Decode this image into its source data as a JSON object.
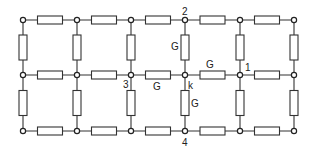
{
  "diagram": {
    "type": "resistor-grid-network",
    "columns_x": [
      23,
      77,
      131,
      185,
      240,
      294
    ],
    "rows_y": [
      20,
      75,
      131
    ],
    "resistor": {
      "length": 25,
      "thickness": 8
    },
    "node_labels": [
      {
        "text": "2",
        "x": 182,
        "y": 15
      },
      {
        "text": "1",
        "x": 245,
        "y": 71
      },
      {
        "text": "3",
        "x": 123,
        "y": 88
      },
      {
        "text": "k",
        "x": 188,
        "y": 89
      },
      {
        "text": "4",
        "x": 182,
        "y": 146
      }
    ],
    "conductance_labels": [
      {
        "text": "G",
        "x": 171,
        "y": 50
      },
      {
        "text": "G",
        "x": 206,
        "y": 68
      },
      {
        "text": "G",
        "x": 153,
        "y": 90
      },
      {
        "text": "G",
        "x": 191,
        "y": 107
      }
    ]
  }
}
